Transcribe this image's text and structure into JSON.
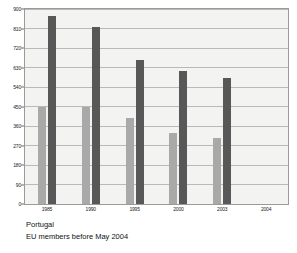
{
  "chart_data": {
    "type": "bar",
    "title": "",
    "xlabel": "",
    "ylabel": "",
    "categories": [
      "1985",
      "1990",
      "1995",
      "2000",
      "2003",
      "2004"
    ],
    "series": [
      {
        "name": "Portugal",
        "color": "#a9a9a9",
        "values": [
          450,
          450,
          395,
          330,
          305,
          null
        ]
      },
      {
        "name": "EU members before May 2004",
        "color": "#585858",
        "values": [
          870,
          815,
          665,
          615,
          580,
          null
        ]
      }
    ],
    "ylim": [
      0,
      900
    ],
    "yticks": [
      0,
      90,
      180,
      270,
      360,
      450,
      540,
      630,
      720,
      810,
      900
    ],
    "ytick_labels": [
      "0",
      "90",
      "180",
      "270",
      "360",
      "450",
      "540",
      "630",
      "720",
      "810",
      "900"
    ],
    "grid": true,
    "legend_position": "below-left"
  },
  "legend": {
    "entries": [
      {
        "label": "Portugal"
      },
      {
        "label": "EU members before May 2004"
      }
    ]
  },
  "colors": {
    "series_light": "#a9a9a9",
    "series_dark": "#585858",
    "plot_background": "#f3f3f2",
    "gridline": "#b9b9b9",
    "axis": "#7a7a7a"
  }
}
